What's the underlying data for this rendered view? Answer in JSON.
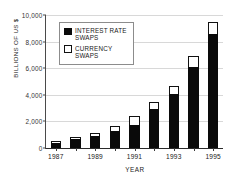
{
  "chart_data": {
    "type": "bar",
    "subtype": "stacked",
    "title": "",
    "xlabel": "YEAR",
    "ylabel": "BILLIONS OF US $",
    "categories": [
      "1987",
      "1988",
      "1989",
      "1990",
      "1991",
      "1992",
      "1993",
      "1994",
      "1995"
    ],
    "tick_labels": [
      "1987",
      "",
      "1989",
      "",
      "1991",
      "",
      "1993",
      "",
      "1995"
    ],
    "series": [
      {
        "name": "INTEREST RATE SWAPS",
        "color": "#0a0a0a",
        "values": [
          400,
          650,
          900,
          1300,
          1700,
          2900,
          4050,
          6100,
          8600
        ]
      },
      {
        "name": "CURRENCY SWAPS",
        "color": "#ffffff",
        "values": [
          150,
          200,
          250,
          350,
          700,
          550,
          650,
          800,
          900
        ]
      }
    ],
    "totals": [
      550,
      850,
      1150,
      1650,
      2400,
      3450,
      4700,
      6900,
      9500
    ],
    "ylim": [
      0,
      10000
    ],
    "yticks": [
      0,
      2000,
      4000,
      6000,
      8000,
      10000
    ],
    "ytick_labels": [
      "0",
      "2,000",
      "4,000",
      "6,000",
      "8,000",
      "10,000"
    ],
    "grid": true,
    "legend_position": "top-left"
  },
  "legend": {
    "items": [
      {
        "label": "INTEREST RATE\nSWAPS",
        "style": "filled"
      },
      {
        "label": "CURRENCY\nSWAPS",
        "style": "hollow"
      }
    ]
  }
}
